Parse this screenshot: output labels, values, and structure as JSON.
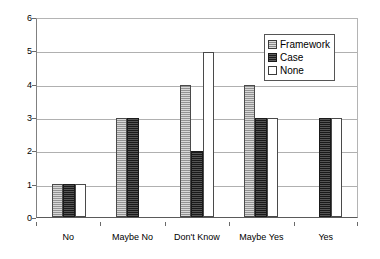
{
  "chart_data": {
    "type": "bar",
    "title": "",
    "subtitle": "",
    "xlabel": "",
    "ylabel": "",
    "categories": [
      "No",
      "Maybe No",
      "Don't Know",
      "Maybe Yes",
      "Yes"
    ],
    "series": [
      {
        "name": "Framework",
        "values": [
          1,
          3,
          4,
          4,
          0
        ],
        "color": "#a8a8a8",
        "pattern": "light-dither"
      },
      {
        "name": "Case",
        "values": [
          1,
          3,
          2,
          3,
          3
        ],
        "color": "#343434",
        "pattern": "dark-dither"
      },
      {
        "name": "None",
        "values": [
          1,
          0,
          5,
          3,
          3
        ],
        "color": "#ffffff",
        "pattern": "solid-white"
      }
    ],
    "ylim": [
      0,
      6
    ],
    "ytick_values": [
      0,
      1,
      2,
      3,
      4,
      5,
      6
    ],
    "ytick_labels": [
      "0",
      "1",
      "2",
      "3",
      "4",
      "5",
      "6"
    ],
    "grid": true,
    "grid_axis": "y",
    "legend_position": "top-right",
    "legend_entries": [
      "Framework",
      "Case",
      "None"
    ],
    "annotations": []
  }
}
